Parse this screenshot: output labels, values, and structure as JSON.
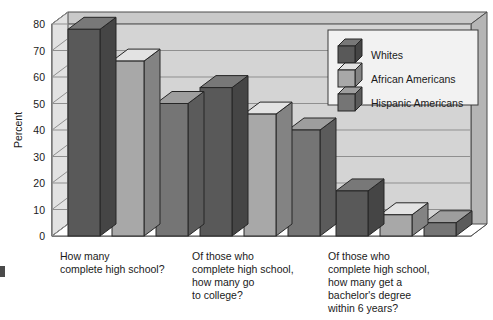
{
  "chart_data": {
    "type": "bar",
    "title": "",
    "subtitle": "",
    "xlabel": "",
    "ylabel": "Percent",
    "ylim": [
      0,
      80
    ],
    "yticks": [
      0,
      10,
      20,
      30,
      40,
      50,
      60,
      70,
      80
    ],
    "ytick_labels": [
      "0",
      "10",
      "20",
      "30",
      "40",
      "50",
      "60",
      "70",
      "80"
    ],
    "grid": true,
    "grid_axis": "y",
    "legend_position": "top-right",
    "style": "3d-grouped-bars",
    "categories": [
      "How many\ncomplete high school?",
      "Of those who\ncomplete high school,\nhow many go\nto college?",
      "Of those who\ncomplete high school,\nhow many get a\nbachelor's degree\nwithin 6 years?"
    ],
    "category_lines": [
      [
        "How many",
        "complete high school?"
      ],
      [
        "Of those who",
        "complete high school,",
        "how many go",
        "to college?"
      ],
      [
        "Of those who",
        "complete high school,",
        "how many get a",
        "bachelor's degree",
        "within 6 years?"
      ]
    ],
    "series": [
      {
        "name": "Whites",
        "color": "#595959",
        "values": [
          78,
          56,
          17
        ]
      },
      {
        "name": "African Americans",
        "color": "#a8a8a8",
        "values": [
          66,
          46,
          8
        ]
      },
      {
        "name": "Hispanic Americans",
        "color": "#757575",
        "values": [
          50,
          40,
          5
        ]
      }
    ]
  },
  "legend": {
    "entries": [
      {
        "label": "Whites"
      },
      {
        "label": "African Americans"
      },
      {
        "label": "Hispanic Americans"
      }
    ]
  },
  "axis": {
    "y_title": "Percent"
  }
}
